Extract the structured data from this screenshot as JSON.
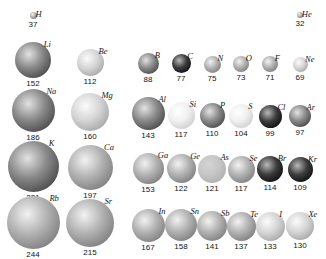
{
  "figure": {
    "title": "",
    "units": "pm"
  },
  "chart_data": {
    "type": "scatter",
    "title": "",
    "subtitle": "",
    "xlabel": "",
    "ylabel": "",
    "legend": [],
    "grid": false,
    "value_unit": "pm",
    "encoding": "sphere diameter proportional to atomic radius",
    "groups_left": [
      "1",
      "2"
    ],
    "groups_right": [
      "13",
      "14",
      "15",
      "16",
      "17",
      "18"
    ],
    "categories": [
      "H",
      "He",
      "Li",
      "Be",
      "B",
      "C",
      "N",
      "O",
      "F",
      "Ne",
      "Na",
      "Mg",
      "Al",
      "Si",
      "P",
      "S",
      "Cl",
      "Ar",
      "K",
      "Ca",
      "Ga",
      "Ge",
      "As",
      "Se",
      "Br",
      "Kr",
      "Rb",
      "Sr",
      "In",
      "Sn",
      "Sb",
      "Te",
      "I",
      "Xe"
    ],
    "values": [
      37,
      32,
      152,
      112,
      88,
      77,
      75,
      73,
      71,
      69,
      186,
      160,
      143,
      117,
      110,
      104,
      99,
      97,
      231,
      197,
      153,
      122,
      121,
      117,
      114,
      109,
      244,
      215,
      167,
      158,
      141,
      137,
      133,
      130
    ],
    "rows": [
      {
        "period": "1",
        "elements": [
          {
            "symbol": "H",
            "value": "37",
            "radius": 37,
            "x": 33,
            "cy": 15,
            "d": 7,
            "shade": "mid",
            "group": "1"
          },
          {
            "symbol": "He",
            "value": "32",
            "radius": 32,
            "x": 300,
            "cy": 15,
            "d": 6,
            "shade": "mid",
            "group": "18"
          }
        ]
      },
      {
        "period": "2",
        "elements": [
          {
            "symbol": "Li",
            "value": "152",
            "radius": 152,
            "x": 33,
            "cy": 60,
            "d": 36,
            "shade": "dark",
            "group": "1"
          },
          {
            "symbol": "Be",
            "value": "112",
            "radius": 112,
            "x": 90,
            "cy": 62,
            "d": 27,
            "shade": "light",
            "group": "2"
          },
          {
            "symbol": "B",
            "value": "88",
            "radius": 88,
            "x": 148,
            "cy": 63,
            "d": 21,
            "shade": "dark",
            "group": "13"
          },
          {
            "symbol": "C",
            "value": "77",
            "radius": 77,
            "x": 181,
            "cy": 63,
            "d": 19,
            "shade": "verydark",
            "group": "14"
          },
          {
            "symbol": "N",
            "value": "75",
            "radius": 75,
            "x": 212,
            "cy": 64,
            "d": 17,
            "shade": "mid",
            "group": "15"
          },
          {
            "symbol": "O",
            "value": "73",
            "radius": 73,
            "x": 241,
            "cy": 64,
            "d": 16,
            "shade": "mid",
            "group": "16"
          },
          {
            "symbol": "F",
            "value": "71",
            "radius": 71,
            "x": 270,
            "cy": 64,
            "d": 16,
            "shade": "mid",
            "group": "17"
          },
          {
            "symbol": "Ne",
            "value": "69",
            "radius": 69,
            "x": 300,
            "cy": 64,
            "d": 15,
            "shade": "light",
            "group": "18"
          }
        ]
      },
      {
        "period": "3",
        "elements": [
          {
            "symbol": "Na",
            "value": "186",
            "radius": 186,
            "x": 33,
            "cy": 110,
            "d": 43,
            "shade": "dark",
            "group": "1"
          },
          {
            "symbol": "Mg",
            "value": "160",
            "radius": 160,
            "x": 90,
            "cy": 112,
            "d": 38,
            "shade": "light",
            "group": "2"
          },
          {
            "symbol": "Al",
            "value": "143",
            "radius": 143,
            "x": 148,
            "cy": 113,
            "d": 33,
            "shade": "dark",
            "group": "13"
          },
          {
            "symbol": "Si",
            "value": "117",
            "radius": 117,
            "x": 181,
            "cy": 115,
            "d": 27,
            "shade": "verylight",
            "group": "14"
          },
          {
            "symbol": "P",
            "value": "110",
            "radius": 110,
            "x": 212,
            "cy": 115,
            "d": 25,
            "shade": "dark",
            "group": "15"
          },
          {
            "symbol": "S",
            "value": "104",
            "radius": 104,
            "x": 241,
            "cy": 116,
            "d": 24,
            "shade": "verylight",
            "group": "16"
          },
          {
            "symbol": "Cl",
            "value": "99",
            "radius": 99,
            "x": 270,
            "cy": 116,
            "d": 23,
            "shade": "verydark",
            "group": "17"
          },
          {
            "symbol": "Ar",
            "value": "97",
            "radius": 97,
            "x": 300,
            "cy": 116,
            "d": 22,
            "shade": "dark",
            "group": "18"
          }
        ]
      },
      {
        "period": "4",
        "elements": [
          {
            "symbol": "K",
            "value": "231",
            "radius": 231,
            "x": 33,
            "cy": 166,
            "d": 51,
            "shade": "dark",
            "group": "1"
          },
          {
            "symbol": "Ca",
            "value": "197",
            "radius": 197,
            "x": 90,
            "cy": 167,
            "d": 45,
            "shade": "mid",
            "group": "2"
          },
          {
            "symbol": "Ga",
            "value": "153",
            "radius": 153,
            "x": 148,
            "cy": 168,
            "d": 31,
            "shade": "mid",
            "group": "13"
          },
          {
            "symbol": "Ge",
            "value": "122",
            "radius": 122,
            "x": 181,
            "cy": 168,
            "d": 29,
            "shade": "mid",
            "group": "14"
          },
          {
            "symbol": "As",
            "value": "121",
            "radius": 121,
            "x": 212,
            "cy": 169,
            "d": 28,
            "shade": "flatlight",
            "group": "15"
          },
          {
            "symbol": "Se",
            "value": "117",
            "radius": 117,
            "x": 241,
            "cy": 169,
            "d": 27,
            "shade": "mid",
            "group": "16"
          },
          {
            "symbol": "Br",
            "value": "114",
            "radius": 114,
            "x": 270,
            "cy": 169,
            "d": 26,
            "shade": "verydark",
            "group": "17"
          },
          {
            "symbol": "Kr",
            "value": "109",
            "radius": 109,
            "x": 300,
            "cy": 169,
            "d": 25,
            "shade": "verydark",
            "group": "18"
          }
        ]
      },
      {
        "period": "5",
        "elements": [
          {
            "symbol": "Rb",
            "value": "244",
            "radius": 244,
            "x": 33,
            "cy": 222,
            "d": 53,
            "shade": "mid",
            "group": "1"
          },
          {
            "symbol": "Sr",
            "value": "215",
            "radius": 215,
            "x": 90,
            "cy": 223,
            "d": 48,
            "shade": "mid",
            "group": "2"
          },
          {
            "symbol": "In",
            "value": "167",
            "radius": 167,
            "x": 148,
            "cy": 225,
            "d": 33,
            "shade": "mid",
            "group": "13"
          },
          {
            "symbol": "Sn",
            "value": "158",
            "radius": 158,
            "x": 181,
            "cy": 225,
            "d": 32,
            "shade": "mid",
            "group": "14"
          },
          {
            "symbol": "Sb",
            "value": "141",
            "radius": 141,
            "x": 212,
            "cy": 226,
            "d": 30,
            "shade": "mid",
            "group": "15"
          },
          {
            "symbol": "Te",
            "value": "137",
            "radius": 137,
            "x": 241,
            "cy": 226,
            "d": 29,
            "shade": "mid",
            "group": "16"
          },
          {
            "symbol": "I",
            "value": "133",
            "radius": 133,
            "x": 270,
            "cy": 226,
            "d": 29,
            "shade": "light",
            "group": "17"
          },
          {
            "symbol": "Xe",
            "value": "130",
            "radius": 130,
            "x": 300,
            "cy": 226,
            "d": 28,
            "shade": "light",
            "group": "18"
          }
        ]
      }
    ]
  },
  "palette": {
    "verylight": "#e8e8e8",
    "light": "#c9c9c9",
    "mid": "#a0a0a0",
    "flatlight": "#bdbdbd",
    "dark": "#6e6e6e",
    "verydark": "#2a2a2a",
    "label_color": "#141414",
    "background": "#ffffff"
  }
}
